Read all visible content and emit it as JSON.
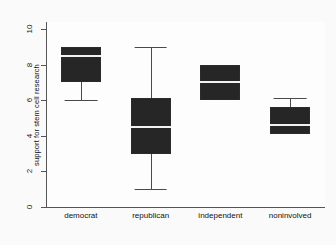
{
  "chart_data": {
    "type": "bar",
    "plot_kind": "box",
    "title": "",
    "xlabel": "",
    "ylabel": "support for stem cell research",
    "ylim": [
      0,
      10.4
    ],
    "yticks": [
      0,
      2,
      4,
      6,
      8,
      10
    ],
    "ytick_labels": [
      "0",
      "2",
      "4",
      "6",
      "8",
      "10"
    ],
    "grid": false,
    "legend": null,
    "categories": [
      "democrat",
      "republican",
      "independent",
      "noninvolved"
    ],
    "series": [
      {
        "name": "support for stem cell research",
        "boxes": [
          {
            "category": "democrat",
            "whisker_low": 6.0,
            "q1": 7.0,
            "median": 8.5,
            "q3": 9.0,
            "whisker_high": 9.0
          },
          {
            "category": "republican",
            "whisker_low": 1.0,
            "q1": 3.0,
            "median": 4.5,
            "q3": 6.1,
            "whisker_high": 9.0
          },
          {
            "category": "independent",
            "whisker_low": 6.0,
            "q1": 6.0,
            "median": 7.0,
            "q3": 8.0,
            "whisker_high": 8.0
          },
          {
            "category": "noninvolved",
            "whisker_low": 4.1,
            "q1": 4.1,
            "median": 4.6,
            "q3": 5.6,
            "whisker_high": 6.1
          }
        ]
      }
    ],
    "colors": {
      "box_fill": "#262626",
      "median_line": "#f2f2f2",
      "whisker": "#4a4a4a",
      "axis": "#555555",
      "background": "#fafafa"
    }
  }
}
